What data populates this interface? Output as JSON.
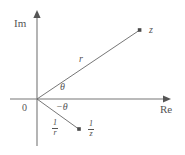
{
  "figure": {
    "type": "complex-plane-diagram",
    "background_color": "#ffffff",
    "stroke_color": "#555555",
    "axes": {
      "imaginary_label": "Im",
      "real_label": "Re",
      "origin_label": "0",
      "vertical_axis": {
        "x": 37,
        "y_top": 12,
        "y_bottom": 146
      },
      "horizontal_axis": {
        "y": 99,
        "x_left": 10,
        "x_right": 170
      }
    },
    "points": [
      {
        "name": "z",
        "label": "z",
        "x": 140,
        "y": 30,
        "label_x": 149,
        "label_y": 25
      },
      {
        "name": "one-over-z",
        "label": "1/z",
        "numerator": "1",
        "denominator": "z",
        "x": 79,
        "y": 129,
        "label_x": 88,
        "label_y": 121
      }
    ],
    "rays": [
      {
        "name": "ray-to-z",
        "from_x": 37,
        "from_y": 99,
        "to_x": 140,
        "to_y": 30,
        "magnitude_label": "r",
        "magnitude_label_x": 79,
        "magnitude_label_y": 54
      },
      {
        "name": "ray-to-one-over-z",
        "from_x": 37,
        "from_y": 99,
        "to_x": 79,
        "to_y": 129,
        "magnitude_numerator": "1",
        "magnitude_denominator": "r",
        "magnitude_label_x": 53,
        "magnitude_label_y": 120
      }
    ],
    "angles": [
      {
        "name": "theta",
        "label": "θ",
        "label_x": 60,
        "label_y": 82
      },
      {
        "name": "negative-theta",
        "label": "−θ",
        "label_x": 56,
        "label_y": 102
      }
    ]
  }
}
